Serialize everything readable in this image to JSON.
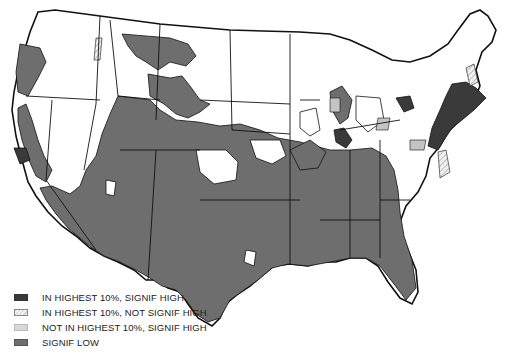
{
  "map": {
    "title": "",
    "region": "Contiguous United States",
    "colors": {
      "highest_signif_high": "#3a3a3a",
      "highest_not_signif_high": "#e0e0e0",
      "not_highest_signif_high": "#c4c4c4",
      "signif_low": "#6e6e6e",
      "no_category": "#ffffff",
      "border": "#111111"
    }
  },
  "legend": {
    "items": [
      {
        "label": "IN HIGHEST 10%, SIGNIF HIGH",
        "swatch": "dark-solid"
      },
      {
        "label": "IN HIGHEST 10%, NOT SIGNIF HIGH",
        "swatch": "hatched"
      },
      {
        "label": "NOT IN HIGHEST 10%, SIGNIF HIGH",
        "swatch": "light-solid"
      },
      {
        "label": "SIGNIF LOW",
        "swatch": "medium-solid"
      }
    ]
  }
}
